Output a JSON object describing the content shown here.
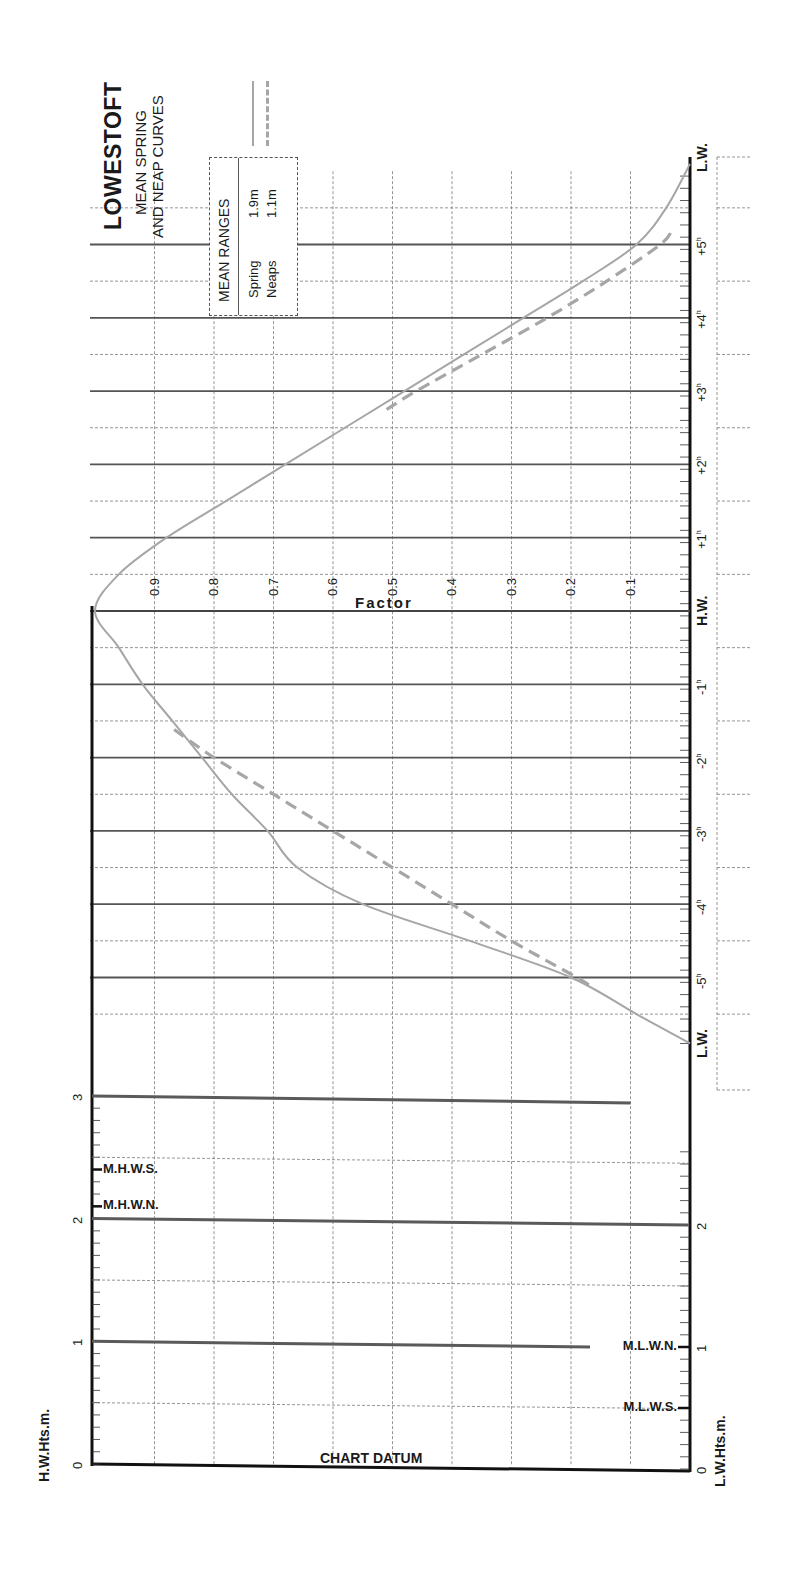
{
  "header": {
    "title": "LOWESTOFT",
    "subtitle_line1": "MEAN SPRING",
    "subtitle_line2": "AND NEAP CURVES"
  },
  "legend": {
    "heading": "MEAN RANGES",
    "rows": [
      {
        "label": "Spring",
        "value": "1.9m",
        "style": "solid"
      },
      {
        "label": "Neaps",
        "value": "1.1m",
        "style": "dashed"
      }
    ]
  },
  "axes": {
    "factor_title": "Factor",
    "factor_ticks": [
      "0.9",
      "0.8",
      "0.7",
      "0.6",
      "0.5",
      "0.4",
      "0.3",
      "0.2",
      "0.1"
    ],
    "time_labels": [
      {
        "label": "L.W.",
        "hours": 6.2,
        "bold": true
      },
      {
        "label": "+5",
        "hours": 5,
        "sup": "h"
      },
      {
        "label": "+4",
        "hours": 4,
        "sup": "h"
      },
      {
        "label": "+3",
        "hours": 3,
        "sup": "h"
      },
      {
        "label": "+2",
        "hours": 2,
        "sup": "h"
      },
      {
        "label": "+1",
        "hours": 1,
        "sup": "h"
      },
      {
        "label": "H.W.",
        "hours": 0,
        "bold": true
      },
      {
        "label": "-1",
        "hours": -1,
        "sup": "h"
      },
      {
        "label": "-2",
        "hours": -2,
        "sup": "h"
      },
      {
        "label": "-3",
        "hours": -3,
        "sup": "h"
      },
      {
        "label": "-4",
        "hours": -4,
        "sup": "h"
      },
      {
        "label": "-5",
        "hours": -5,
        "sup": "h"
      },
      {
        "label": "L.W.",
        "hours": -5.9,
        "bold": true
      }
    ],
    "hw_heights_label": "H.W.Hts.m.",
    "lw_heights_label": "L.W.Hts.m.",
    "hw_height_ticks": [
      "0",
      "1",
      "2",
      "3"
    ],
    "lw_height_ticks": [
      "0",
      "1",
      "2"
    ],
    "chart_datum_label": "CHART DATUM"
  },
  "markers": {
    "hw": [
      {
        "label": "M.H.W.S.",
        "height": 2.4
      },
      {
        "label": "M.H.W.N.",
        "height": 2.1
      }
    ],
    "lw": [
      {
        "label": "M.L.W.N.",
        "height": 1.0
      },
      {
        "label": "M.L.W.S.",
        "height": 0.5
      }
    ]
  },
  "colors": {
    "curve": "#a6a6a6",
    "grid": "#7a7a7a",
    "axis": "#111111",
    "heavy_line": "#5a5a5a"
  },
  "chart_data": {
    "type": "line",
    "orientation": "rotated 90° (time axis vertical, factor axis horizontal)",
    "xlabel": "Hours relative to H.W.",
    "ylabel": "Factor",
    "xlim": [
      -6,
      6
    ],
    "ylim": [
      0,
      1
    ],
    "grid": true,
    "legend_position": "top-left",
    "series": [
      {
        "name": "Spring (mean range 1.9m)",
        "style": "solid",
        "x": [
          -5.9,
          -5.5,
          -5,
          -4.5,
          -4,
          -3.5,
          -3,
          -2.5,
          -2,
          -1.5,
          -1,
          -0.5,
          0,
          0.5,
          1,
          1.5,
          2,
          2.5,
          3,
          3.5,
          4,
          4.5,
          5,
          5.5,
          6.1
        ],
        "y": [
          0.0,
          0.09,
          0.2,
          0.37,
          0.55,
          0.66,
          0.71,
          0.77,
          0.82,
          0.87,
          0.92,
          0.96,
          1.0,
          0.96,
          0.88,
          0.78,
          0.68,
          0.58,
          0.48,
          0.38,
          0.28,
          0.18,
          0.09,
          0.04,
          0.0
        ]
      },
      {
        "name": "Neaps (mean range 1.1m)",
        "style": "dashed",
        "x": [
          -5.1,
          -5,
          -4.5,
          -4,
          -3.5,
          -3,
          -2.5,
          -2,
          -1.6
        ],
        "y": [
          0.17,
          0.19,
          0.3,
          0.4,
          0.5,
          0.6,
          0.7,
          0.8,
          0.87
        ]
      },
      {
        "name": "Neaps (falling)",
        "style": "dashed",
        "x": [
          2.75,
          3,
          3.5,
          4,
          4.5,
          5,
          5.2
        ],
        "y": [
          0.51,
          0.46,
          0.35,
          0.24,
          0.14,
          0.05,
          0.03
        ]
      }
    ],
    "height_panel": {
      "hw_axis": {
        "label": "H.W.Hts.m.",
        "range": [
          0,
          3
        ],
        "ticks": [
          0,
          1,
          2,
          3
        ]
      },
      "lw_axis": {
        "label": "L.W.Hts.m.",
        "range": [
          0,
          2
        ],
        "ticks": [
          0,
          1,
          2
        ]
      },
      "levels": {
        "MHWS": 2.4,
        "MHWN": 2.1,
        "MLWN": 1.0,
        "MLWS": 0.5
      },
      "datum": "CHART DATUM"
    }
  }
}
